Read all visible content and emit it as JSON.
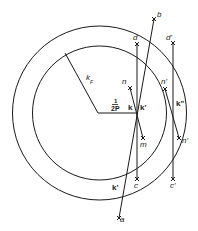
{
  "diagram": {
    "colors": {
      "stroke": "#1a1a1a",
      "background": "#ffffff"
    },
    "circles": [
      {
        "name": "outer-sphere",
        "cx": 99.5,
        "cy": 113,
        "r": 87
      },
      {
        "name": "inner-fermi-sphere",
        "cx": 99.5,
        "cy": 113,
        "r": 67
      }
    ],
    "labels": {
      "kF": "k",
      "kF_sub": "F",
      "half": "1",
      "P": "2P",
      "k": "k",
      "k_prime": "k'",
      "k_double": "k\"",
      "k_prime_lower": "k'",
      "n": "n",
      "n_prime": "n'",
      "n_double": "n'",
      "m": "m",
      "d": "d",
      "d_prime": "d'",
      "b": "b",
      "c": "c",
      "c_prime": "c'",
      "a": "a"
    },
    "points": {
      "center": [
        98,
        113
      ],
      "k": [
        136,
        113
      ],
      "kF_edge": [
        65,
        53
      ],
      "d": [
        137,
        44
      ],
      "b": [
        154,
        19
      ],
      "n": [
        130,
        88
      ],
      "m": [
        143,
        138
      ],
      "c": [
        137,
        179
      ],
      "a": [
        119,
        218
      ],
      "d_prime": [
        173,
        43
      ],
      "n_prime": [
        165,
        89
      ],
      "n_double": [
        179,
        138
      ],
      "c_prime": [
        173,
        179
      ]
    }
  }
}
